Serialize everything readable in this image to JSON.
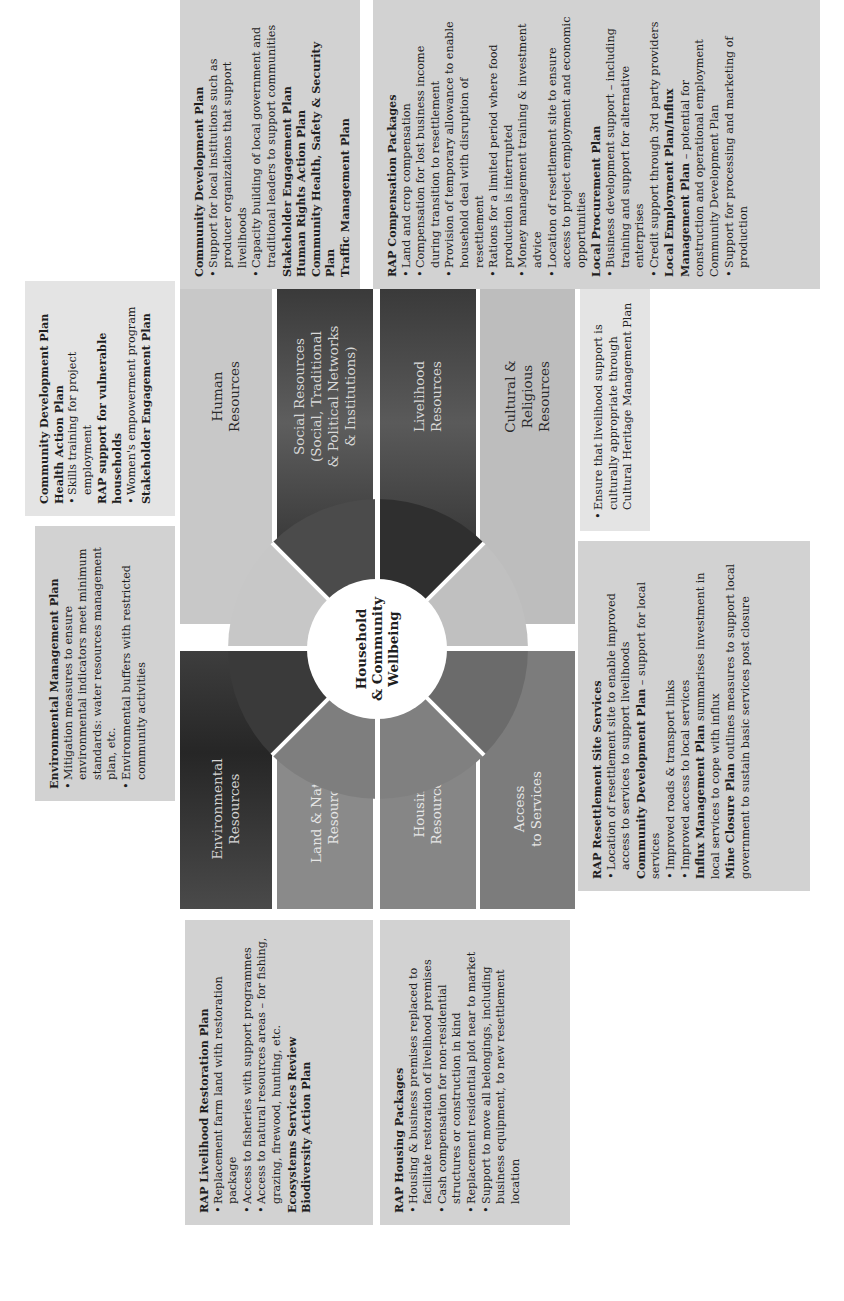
{
  "page": {
    "title_fragment": "g",
    "center_label": "Household\n& Community\nWellbeing"
  },
  "resources": {
    "environmental": "Environmental\nResources",
    "land_natural": "Land & Natural\nResources",
    "housing": "Housing\nResources",
    "access_services": "Access\nto Services",
    "human": "Human\nResources",
    "social": "Social Resources\n(Social, Traditional\n& Political Networks\n& Institutions)",
    "livelihood": "Livelihood\nResources",
    "cultural": "Cultural &\nReligious\nResources"
  },
  "boxes": {
    "environmental_mgmt": {
      "heading": "Environmental Management Plan",
      "bullets": [
        "Mitigation measures to ensure environmental indicators meet minimum standards: water resources management plan, etc.",
        "Environmental buffers with restricted community activities"
      ]
    },
    "human": {
      "lines": [
        {
          "text": "Community Development Plan",
          "bold": true,
          "bullet": false
        },
        {
          "text": "Health Action Plan",
          "bold": true,
          "bullet": false
        },
        {
          "text": "Skills training for project employment",
          "bold": false,
          "bullet": true
        },
        {
          "text": "RAP support for vulnerable households",
          "bold": true,
          "bullet": false
        },
        {
          "text": "Women's empowerment program",
          "bold": false,
          "bullet": true
        },
        {
          "text": "Stakeholder Engagement Plan",
          "bold": true,
          "bullet": false
        }
      ]
    },
    "social": {
      "heading": "Community Development Plan",
      "bullets": [
        "Support for local institutions such as producer organizations that support livelihoods",
        "Capacity building of local government and traditional leaders to support communities"
      ],
      "plans": [
        "Stakeholder Engagement Plan",
        "Human Rights Action Plan",
        "Community Health, Safety & Security Plan",
        "Traffic Management Plan"
      ]
    },
    "livelihood": {
      "heading": "RAP Compensation Packages",
      "bullets": [
        "Land and crop compensation",
        "Compensation for lost business income during transition to resettlement",
        "Provision of temporary allowance to enable household deal with disruption of resettlement",
        "Rations for a limited period where food production is interrupted",
        "Money management training & investment advice",
        "Location of resettlement site to ensure access to project employment and economic opportunities"
      ],
      "procurement_heading": "Local Procurement Plan",
      "procurement_bullets": [
        "Business development support – including training and support for alternative enterprises",
        "Credit support through 3rd party providers"
      ],
      "employment_heading": "Local Employment Plan/Influx Management Plan",
      "employment_text": " – potential for construction and operational employment",
      "cdp_text": "Community Development Plan",
      "cdp_bullets": [
        "Support for processing and marketing of production"
      ]
    },
    "cultural": {
      "bullets": [
        "Ensure that livelihood support is culturally appropriate through Cultural Heritage Management Plan"
      ]
    },
    "access_services": {
      "heading": "RAP Resettlement Site Services",
      "bullets1": [
        "Location of resettlement site to enable improved access to services to support livelihoods"
      ],
      "cdp_bold": "Community Development Plan",
      "cdp_rest": " – support for local services",
      "bullets2": [
        "Improved roads & transport links",
        "Improved access to local services"
      ],
      "influx_bold": "Influx Management Plan",
      "influx_rest": " summarises investment in local services to cope with influx",
      "mine_bold": "Mine Closure Plan",
      "mine_rest": " outlines measures to support local government to sustain basic services post closure"
    },
    "land_natural": {
      "heading": "RAP Livelihood Restoration Plan",
      "bullets": [
        "Replacement farm land with restoration package",
        "Access to fisheries with support programmes",
        "Access to natural resources areas – for fishing, grazing, firewood, hunting, etc."
      ],
      "plans": [
        "Ecosystems Services Review",
        "Biodiversity Action Plan"
      ]
    },
    "housing": {
      "heading": "RAP Housing Packages",
      "bullets": [
        "Housing & business premises replaced to facilitate restoration of livelihood premises",
        "Cash compensation for non-residential structures or construction in kind",
        "Replacement residential plot near to market",
        "Support to move all belongings, including business equipment, to new resettlement location"
      ]
    }
  },
  "colors": {
    "box_fill": "#d2d2d2",
    "box_fill_light": "#e4e4e4",
    "dark_tile": "#3a3a3a",
    "mid_tile": "#8f8f8f",
    "light_tile": "#c4c4c4"
  }
}
